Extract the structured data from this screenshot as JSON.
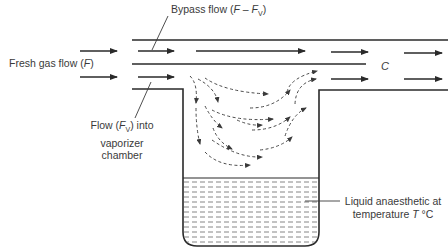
{
  "diagram": {
    "labels": {
      "bypass_flow": "Bypass flow (F – F",
      "bypass_flow_parts": {
        "prefix": "Bypass flow (",
        "F": "F",
        "minus": " – ",
        "Fv": "F",
        "sub": "V",
        "suffix": ")"
      },
      "fresh_gas": {
        "prefix": "Fresh gas flow (",
        "F": "F",
        "suffix": ")"
      },
      "flow_into": {
        "line1_prefix": "Flow (",
        "F": "F",
        "sub": "V",
        "line1_suffix": ") into",
        "line2": "vaporizer",
        "line3": "chamber"
      },
      "outlet_concentration": "C",
      "liquid": {
        "line1": "Liquid anaesthetic at",
        "line2_prefix": "temperature ",
        "T": "T",
        "line2_suffix": " °C"
      }
    },
    "colors": {
      "line": "#2a2a2a",
      "dashed": "#4a4a4a",
      "text": "#3a3a3a",
      "background": "#ffffff"
    }
  }
}
